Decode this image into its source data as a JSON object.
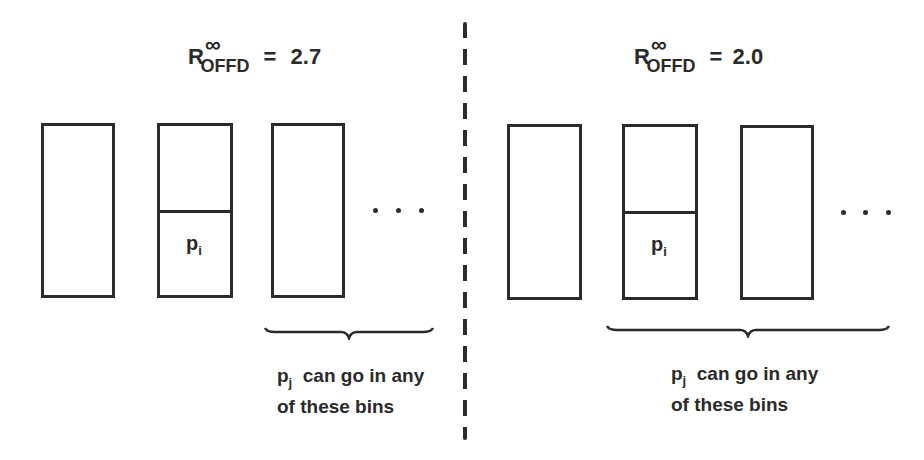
{
  "left_panel": {
    "formula": {
      "symbol": "R",
      "superscript": "∞",
      "subscript": "OFFD",
      "equals": "=",
      "value": "2.7"
    },
    "bins": [
      {
        "id": "bin-1",
        "has_item": false
      },
      {
        "id": "bin-2",
        "has_item": true,
        "item_label": "p",
        "item_sub": "i"
      },
      {
        "id": "bin-3",
        "has_item": false
      }
    ],
    "ellipsis": "...",
    "caption": {
      "var": "p",
      "var_sub": "j",
      "line1": "can go in any",
      "line2": "of these bins"
    }
  },
  "right_panel": {
    "formula": {
      "symbol": "R",
      "superscript": "∞",
      "subscript": "OFFD",
      "equals": "=",
      "value": "2.0"
    },
    "bins": [
      {
        "id": "bin-1",
        "has_item": false
      },
      {
        "id": "bin-2",
        "has_item": true,
        "item_label": "p",
        "item_sub": "i"
      },
      {
        "id": "bin-3",
        "has_item": false
      }
    ],
    "ellipsis": "...",
    "caption": {
      "var": "p",
      "var_sub": "j",
      "line1": "can go in any",
      "line2": "of these bins"
    }
  },
  "colors": {
    "ink": "#2b2b2b",
    "background": "#ffffff"
  }
}
